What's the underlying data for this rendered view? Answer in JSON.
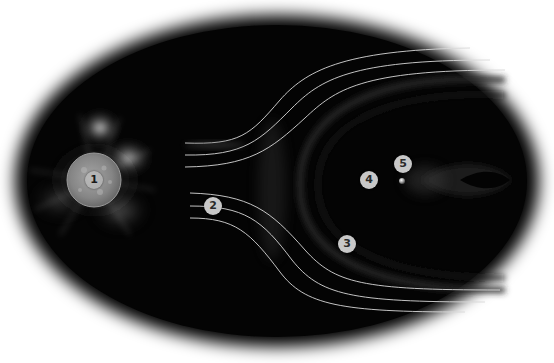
{
  "diagram": {
    "colors": {
      "background": "#ffffff",
      "space": "#050505",
      "field_lines": "#d8d8d8",
      "marker_fill": "#c8c8c8",
      "marker_text": "#2a2a2a",
      "sun_disc": "#8a8a8a"
    },
    "markers": [
      {
        "id": "1",
        "label": "1",
        "target": "sun",
        "x": 94,
        "y": 180
      },
      {
        "id": "2",
        "label": "2",
        "target": "solar-wind",
        "x": 213,
        "y": 206
      },
      {
        "id": "3",
        "label": "3",
        "target": "bow-shock",
        "x": 347,
        "y": 244
      },
      {
        "id": "4",
        "label": "4",
        "target": "magnetosphere",
        "x": 369,
        "y": 180
      },
      {
        "id": "5",
        "label": "5",
        "target": "earth",
        "x": 403,
        "y": 164
      }
    ]
  }
}
